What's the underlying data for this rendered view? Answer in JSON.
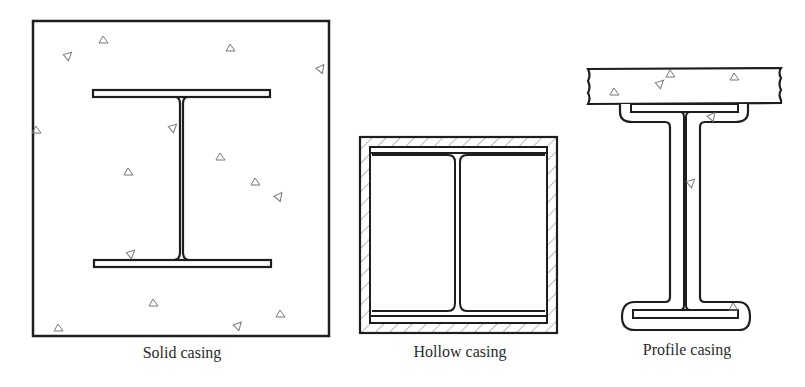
{
  "figure": {
    "panels": [
      {
        "id": "solid",
        "label": "Solid casing",
        "label_x": 182,
        "label_y": 344
      },
      {
        "id": "hollow",
        "label": "Hollow casing",
        "label_x": 460,
        "label_y": 343
      },
      {
        "id": "profile",
        "label": "Profile casing",
        "label_x": 687,
        "label_y": 341
      }
    ],
    "colors": {
      "stroke": "#1e1e1e",
      "aggregate": "#777777",
      "hatch": "#8a8a8a",
      "text": "#2a2a2a"
    }
  }
}
